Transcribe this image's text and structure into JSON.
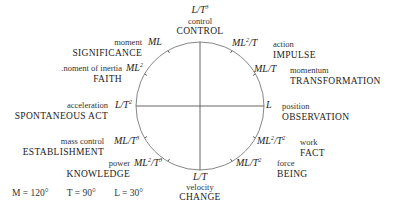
{
  "diagram": {
    "circle": {
      "cx": 200,
      "cy": 106,
      "r": 64,
      "stroke": "#777777"
    },
    "nodes": [
      {
        "id": "top",
        "dim": "L/T³",
        "quantity": "control",
        "concept": "CONTROL"
      },
      {
        "id": "ml",
        "dim": "ML",
        "quantity": "moment",
        "concept": "SIGNIFICANCE"
      },
      {
        "id": "ml2",
        "dim": "ML²",
        "quantity": ".noment of inertia",
        "concept": "FAITH"
      },
      {
        "id": "lt2",
        "dim": "L/T²",
        "quantity": "acceleration",
        "concept": "SPONTANEOUS ACT"
      },
      {
        "id": "mlt3",
        "dim": "ML/T³",
        "quantity": "mass control",
        "concept": "ESTABLISHMENT"
      },
      {
        "id": "ml2t3",
        "dim": "ML²/T³",
        "quantity": "power",
        "concept": "KNOWLEDGE"
      },
      {
        "id": "bottom",
        "dim": "L/T",
        "quantity": "velocity",
        "concept": "CHANGE"
      },
      {
        "id": "mlt2",
        "dim": "ML/T²",
        "quantity": "force",
        "concept": "BEING"
      },
      {
        "id": "ml2t2",
        "dim": "ML²/T²",
        "quantity": "work",
        "concept": "FACT"
      },
      {
        "id": "l",
        "dim": "L",
        "quantity": "position",
        "concept": "OBSERVATION"
      },
      {
        "id": "mlt",
        "dim": "ML/T",
        "quantity": "momentum",
        "concept": "TRANSFORMATION"
      },
      {
        "id": "ml2t",
        "dim": "ML²/T",
        "quantity": "action",
        "concept": "IMPULSE"
      }
    ],
    "legend": {
      "m": "M = 120°",
      "t": "T = 90°",
      "l": "L = 30°"
    }
  }
}
